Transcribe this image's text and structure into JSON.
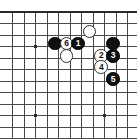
{
  "diagram": {
    "type": "go-board-joseki",
    "title": "",
    "board": {
      "background_color": "#ffffff",
      "line_color": "#4a4a4a",
      "edge_color": "#2a2a2a",
      "cell_size": 11.5,
      "origin_x": 12.5,
      "origin_y": 12.0,
      "cols": 11,
      "rows": 11,
      "edges": {
        "top": true,
        "left": false,
        "right": false,
        "bottom": false
      },
      "star_points": [
        {
          "col": 2,
          "row": 3
        },
        {
          "col": 2,
          "row": 9
        },
        {
          "col": 8,
          "row": 9
        }
      ]
    },
    "stones": [
      {
        "id": "b-plain-1",
        "color": "black",
        "label": "",
        "col": 3.7,
        "row": 2.75
      },
      {
        "id": "w-move-6",
        "color": "white",
        "label": "6",
        "col": 4.7,
        "row": 2.75
      },
      {
        "id": "b-move-1",
        "color": "black",
        "label": "1",
        "col": 5.7,
        "row": 2.75
      },
      {
        "id": "w-plain-1",
        "color": "white",
        "label": "",
        "col": 6.7,
        "row": 1.7
      },
      {
        "id": "b-plain-2",
        "color": "black",
        "label": "",
        "col": 8.75,
        "row": 2.75
      },
      {
        "id": "w-plain-2",
        "color": "white",
        "label": "",
        "col": 4.7,
        "row": 3.8
      },
      {
        "id": "w-move-2",
        "color": "white",
        "label": "2",
        "col": 7.72,
        "row": 3.8
      },
      {
        "id": "b-move-3",
        "color": "black",
        "label": "3",
        "col": 8.75,
        "row": 3.8
      },
      {
        "id": "w-move-4",
        "color": "white",
        "label": "4",
        "col": 7.72,
        "row": 4.8
      },
      {
        "id": "b-move-5",
        "color": "black",
        "label": "5",
        "col": 8.75,
        "row": 5.85
      }
    ],
    "move_labels": [
      "1",
      "2",
      "3",
      "4",
      "5",
      "6"
    ],
    "colors": {
      "black_stone": "#101010",
      "white_stone": "#ffffff",
      "stone_outline": "#2b2b2b",
      "grid": "#4a4a4a",
      "board_edge": "#2a2a2a",
      "black_label_text": "#ffffff",
      "white_label_text": "#111111"
    }
  }
}
